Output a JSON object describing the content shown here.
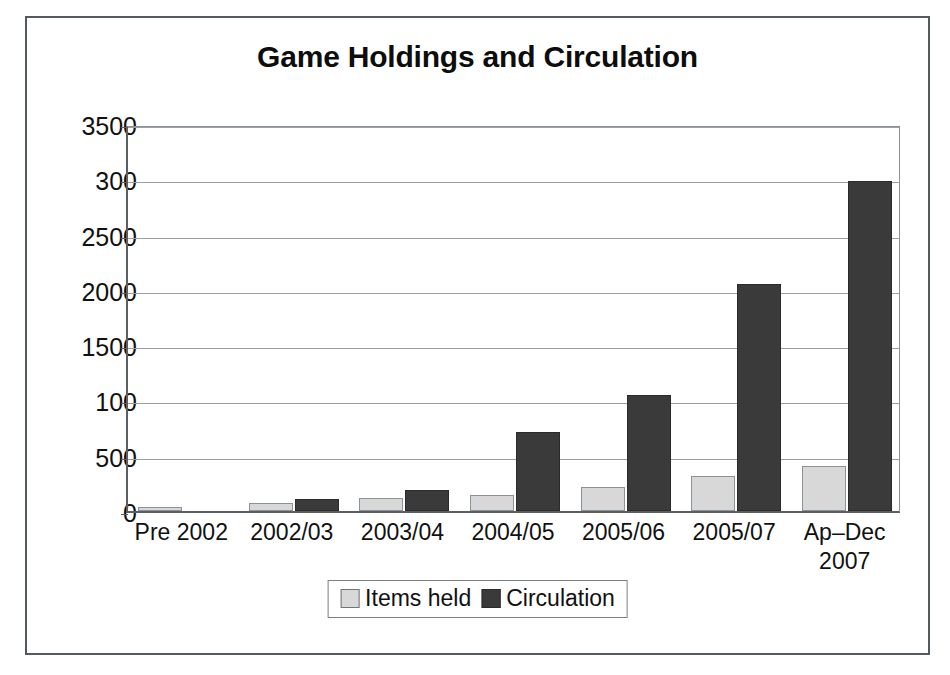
{
  "chart_data": {
    "type": "bar",
    "title": "Game Holdings and Circulation",
    "xlabel": "",
    "ylabel": "",
    "grid": true,
    "legend_position": "bottom",
    "ylim": [
      0,
      3500
    ],
    "ytick_values": [
      0,
      500,
      1000,
      1500,
      2000,
      2500,
      3000,
      3500
    ],
    "ytick_labels": [
      "0",
      "500",
      "100",
      "1500",
      "2000",
      "2500",
      "300",
      "3500"
    ],
    "categories": [
      "Pre 2002",
      "2002/03",
      "2003/04",
      "2004/05",
      "2005/06",
      "2005/07",
      "Ap–Dec\n2007"
    ],
    "series": [
      {
        "name": "Items held",
        "color": "#d8d8d8",
        "values": [
          40,
          70,
          120,
          145,
          215,
          320,
          410
        ]
      },
      {
        "name": "Circulation",
        "color": "#3a3a3a",
        "values": [
          0,
          110,
          190,
          715,
          1050,
          2055,
          2985
        ]
      }
    ]
  },
  "legend": {
    "items": [
      {
        "label": "Items held",
        "swatch": "light"
      },
      {
        "label": "Circulation",
        "swatch": "dark"
      }
    ]
  },
  "colors": {
    "light_bar": "#d8d8d8",
    "dark_bar": "#3a3a3a",
    "gridline": "#9aa0a4",
    "axis": "#5a5f64",
    "frame": "#555a5f",
    "text": "#111111"
  }
}
